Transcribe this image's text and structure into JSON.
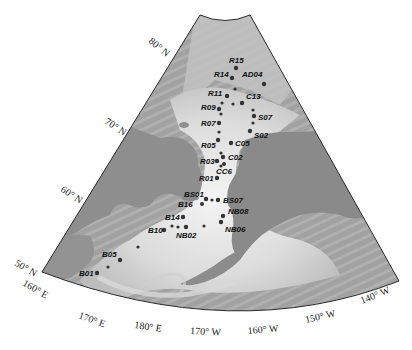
{
  "map": {
    "title": "",
    "region": "Bering Sea - Chukchi Sea - Arctic Ocean",
    "projection": "conic",
    "colors": {
      "frame": "#2a2a2a",
      "land": "#8f8f8f",
      "ocean_deep": "#9e9e9e",
      "shelf": "#e8e8e8",
      "station": "#333333"
    },
    "latitude_labels": [
      {
        "text": "80° N",
        "x": 148,
        "y": 42,
        "rot": 40
      },
      {
        "text": "70° N",
        "x": 104,
        "y": 123,
        "rot": 33
      },
      {
        "text": "60° N",
        "x": 60,
        "y": 191,
        "rot": 33
      },
      {
        "text": "50° N",
        "x": 14,
        "y": 265,
        "rot": 30
      }
    ],
    "longitude_labels": [
      {
        "text": "160° E",
        "x": 22,
        "y": 285,
        "rot": 30
      },
      {
        "text": "170° E",
        "x": 78,
        "y": 318,
        "rot": 20
      },
      {
        "text": "180° E",
        "x": 134,
        "y": 328,
        "rot": 8
      },
      {
        "text": "170° W",
        "x": 190,
        "y": 334,
        "rot": 3
      },
      {
        "text": "160° W",
        "x": 248,
        "y": 334,
        "rot": -5
      },
      {
        "text": "150° W",
        "x": 306,
        "y": 323,
        "rot": -13
      },
      {
        "text": "140° W",
        "x": 362,
        "y": 304,
        "rot": -22
      }
    ],
    "stations": [
      {
        "id": "R15",
        "x": 236,
        "y": 68,
        "lx": 229,
        "ly": 63,
        "size": 2.2
      },
      {
        "id": "R14",
        "x": 232,
        "y": 78,
        "lx": 214,
        "ly": 77,
        "size": 2.2
      },
      {
        "id": "AD04",
        "x": 264,
        "y": 84,
        "lx": 242,
        "ly": 77,
        "size": 2.2
      },
      {
        "id": "",
        "x": 235,
        "y": 89,
        "lx": 0,
        "ly": 0,
        "size": 1.6
      },
      {
        "id": "R11",
        "x": 227,
        "y": 96,
        "lx": 208,
        "ly": 96,
        "size": 2.2
      },
      {
        "id": "",
        "x": 233,
        "y": 104,
        "lx": 0,
        "ly": 0,
        "size": 1.6
      },
      {
        "id": "",
        "x": 222,
        "y": 103,
        "lx": 0,
        "ly": 0,
        "size": 1.6
      },
      {
        "id": "C13",
        "x": 242,
        "y": 103,
        "lx": 246,
        "ly": 99,
        "size": 2.2
      },
      {
        "id": "",
        "x": 253,
        "y": 110,
        "lx": 0,
        "ly": 0,
        "size": 1.6
      },
      {
        "id": "R09",
        "x": 219,
        "y": 109,
        "lx": 201,
        "ly": 110,
        "size": 2.2
      },
      {
        "id": "",
        "x": 221,
        "y": 114,
        "lx": 0,
        "ly": 0,
        "size": 1.6
      },
      {
        "id": "S07",
        "x": 254,
        "y": 116,
        "lx": 258,
        "ly": 120,
        "size": 2.2
      },
      {
        "id": "R07",
        "x": 219,
        "y": 123,
        "lx": 201,
        "ly": 126,
        "size": 2.2
      },
      {
        "id": "",
        "x": 253,
        "y": 123,
        "lx": 0,
        "ly": 0,
        "size": 1.6
      },
      {
        "id": "",
        "x": 219,
        "y": 132,
        "lx": 0,
        "ly": 0,
        "size": 1.6
      },
      {
        "id": "S02",
        "x": 250,
        "y": 131,
        "lx": 254,
        "ly": 138,
        "size": 2.2
      },
      {
        "id": "R05",
        "x": 218,
        "y": 140,
        "lx": 201,
        "ly": 148,
        "size": 2.2
      },
      {
        "id": "C05",
        "x": 231,
        "y": 143,
        "lx": 235,
        "ly": 146,
        "size": 2.2
      },
      {
        "id": "",
        "x": 221,
        "y": 153,
        "lx": 0,
        "ly": 0,
        "size": 1.6
      },
      {
        "id": "C02",
        "x": 223,
        "y": 157,
        "lx": 228,
        "ly": 160,
        "size": 2.2
      },
      {
        "id": "R03",
        "x": 217,
        "y": 161,
        "lx": 200,
        "ly": 164,
        "size": 2.2
      },
      {
        "id": "CC6",
        "x": 224,
        "y": 164,
        "lx": 216,
        "ly": 174,
        "size": 2.0
      },
      {
        "id": "",
        "x": 221,
        "y": 166,
        "lx": 0,
        "ly": 0,
        "size": 1.6
      },
      {
        "id": "R01",
        "x": 217,
        "y": 178,
        "lx": 199,
        "ly": 181,
        "size": 2.2
      },
      {
        "id": "BS01",
        "x": 206,
        "y": 199,
        "lx": 184,
        "ly": 197,
        "size": 2.2
      },
      {
        "id": "",
        "x": 212,
        "y": 200,
        "lx": 0,
        "ly": 0,
        "size": 1.6
      },
      {
        "id": "BS07",
        "x": 218,
        "y": 200,
        "lx": 223,
        "ly": 203,
        "size": 2.2
      },
      {
        "id": "B16",
        "x": 202,
        "y": 204,
        "lx": 178,
        "ly": 207,
        "size": 2.0
      },
      {
        "id": "NB08",
        "x": 223,
        "y": 216,
        "lx": 228,
        "ly": 214,
        "size": 2.2
      },
      {
        "id": "B14",
        "x": 183,
        "y": 217,
        "lx": 165,
        "ly": 220,
        "size": 2.2
      },
      {
        "id": "",
        "x": 221,
        "y": 222,
        "lx": 0,
        "ly": 0,
        "size": 1.6
      },
      {
        "id": "NB06",
        "x": 221,
        "y": 222,
        "lx": 225,
        "ly": 232,
        "size": 2.2
      },
      {
        "id": "",
        "x": 172,
        "y": 226,
        "lx": 0,
        "ly": 0,
        "size": 1.6
      },
      {
        "id": "",
        "x": 178,
        "y": 227,
        "lx": 0,
        "ly": 0,
        "size": 1.6
      },
      {
        "id": "NB02",
        "x": 186,
        "y": 227,
        "lx": 176,
        "ly": 238,
        "size": 2.2
      },
      {
        "id": "B10",
        "x": 164,
        "y": 230,
        "lx": 148,
        "ly": 233,
        "size": 2.2
      },
      {
        "id": "",
        "x": 204,
        "y": 226,
        "lx": 0,
        "ly": 0,
        "size": 1.6
      },
      {
        "id": "",
        "x": 138,
        "y": 247,
        "lx": 0,
        "ly": 0,
        "size": 1.6
      },
      {
        "id": "B05",
        "x": 120,
        "y": 260,
        "lx": 102,
        "ly": 257,
        "size": 2.2
      },
      {
        "id": "",
        "x": 108,
        "y": 267,
        "lx": 0,
        "ly": 0,
        "size": 1.6
      },
      {
        "id": "B01",
        "x": 97,
        "y": 273,
        "lx": 79,
        "ly": 276,
        "size": 2.2
      }
    ]
  }
}
